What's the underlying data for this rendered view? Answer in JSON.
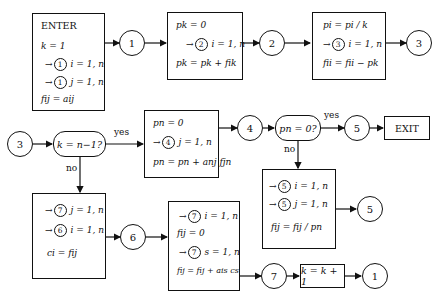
{
  "diagram": {
    "enter_box": {
      "title": "ENTER",
      "lines": [
        "k = 1",
        "i = 1, n",
        "j = 1, n",
        "fij = aij"
      ],
      "loop_refs": [
        "1",
        "1"
      ]
    },
    "box_p_init": {
      "lines": [
        "pk = 0",
        "i = 1, n",
        "pk = pk + fik"
      ],
      "loop_refs": [
        "2"
      ]
    },
    "box_normalize": {
      "lines": [
        "pi = pi / k",
        "i = 1, n",
        "fii = fii − pk"
      ],
      "loop_refs": [
        "3"
      ]
    },
    "decision_k": {
      "text": "k = n−1?",
      "yes": "yes",
      "no": "no"
    },
    "box_pn": {
      "lines": [
        "pn = 0",
        "j = 1, n",
        "pn = pn + anj fjn"
      ],
      "loop_refs": [
        "4"
      ]
    },
    "decision_pn": {
      "text": "pn = 0?",
      "yes": "yes",
      "no": "no"
    },
    "exit_box": {
      "text": "EXIT"
    },
    "box_divide": {
      "lines": [
        "i = 1, n",
        "j = 1, n",
        "fij = fij / pn"
      ],
      "loop_refs": [
        "5",
        "5"
      ]
    },
    "box_copy": {
      "lines": [
        "j = 1, n",
        "i = 1, n",
        "ci = fij"
      ],
      "loop_refs": [
        "7",
        "6"
      ]
    },
    "box_accumulate": {
      "lines": [
        "i = 1, n",
        "fij = 0",
        "s = 1, n",
        "fij = fij + ais cs"
      ],
      "loop_refs": [
        "7",
        "7"
      ]
    },
    "box_increment": {
      "text": "k = k + 1"
    },
    "connectors": {
      "c1_top": "1",
      "c2_top": "2",
      "c3_top": "3",
      "c3_left": "3",
      "c4": "4",
      "c5_yes": "5",
      "c5_div": "5",
      "c6": "6",
      "c7": "7",
      "c1_end": "1"
    }
  }
}
